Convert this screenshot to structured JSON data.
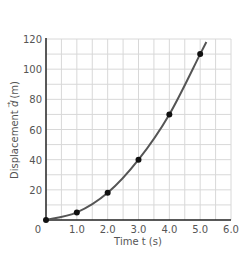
{
  "chart_data": {
    "type": "line",
    "title": "",
    "xlabel": "Time t (s)",
    "ylabel": "Displacement d⃗ (m)",
    "xlim": [
      0,
      6.0
    ],
    "ylim": [
      0,
      120
    ],
    "x_ticks": [
      "0",
      "1.0",
      "2.0",
      "3.0",
      "4.0",
      "5.0",
      "6.0"
    ],
    "y_ticks": [
      "20",
      "40",
      "60",
      "80",
      "100",
      "120"
    ],
    "grid": true,
    "grid_minor_x": 0.5,
    "grid_minor_y": 10,
    "legend": null,
    "series": [
      {
        "name": "displacement",
        "x": [
          0,
          1.0,
          2.0,
          3.0,
          4.0,
          5.0
        ],
        "values": [
          0,
          5,
          18,
          40,
          70,
          110
        ],
        "markers": true,
        "curve_extends_to": [
          5.2,
          118
        ]
      }
    ]
  },
  "axes": {
    "x_label": "Time t (s)",
    "y_label_prefix": "Displacement ",
    "y_label_var": "d",
    "y_label_suffix": " (m)",
    "origin_label": "0"
  },
  "colors": {
    "curve": "#555555",
    "points": "#111111",
    "grid": "#d8d8d8",
    "axis": "#222222",
    "text": "#555555"
  }
}
